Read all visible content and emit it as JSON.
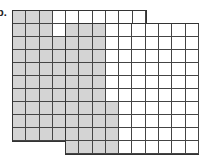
{
  "label": "b.",
  "colors": {
    "shaded": "#d4d4d4",
    "unshaded": "#ffffff",
    "gridline": "#444444"
  },
  "grids": [
    {
      "name": "back-grid",
      "rows": 10,
      "cols": 10,
      "shaded_full_columns": 3,
      "partial_column": {
        "col": 4,
        "shaded_from_row": 3
      },
      "shaded_count": 38
    },
    {
      "name": "front-grid",
      "rows": 10,
      "cols": 10,
      "shaded_full_columns": 3,
      "partial_column": {
        "col": 4,
        "shaded_from_row": 7
      },
      "shaded_count": 34
    }
  ]
}
